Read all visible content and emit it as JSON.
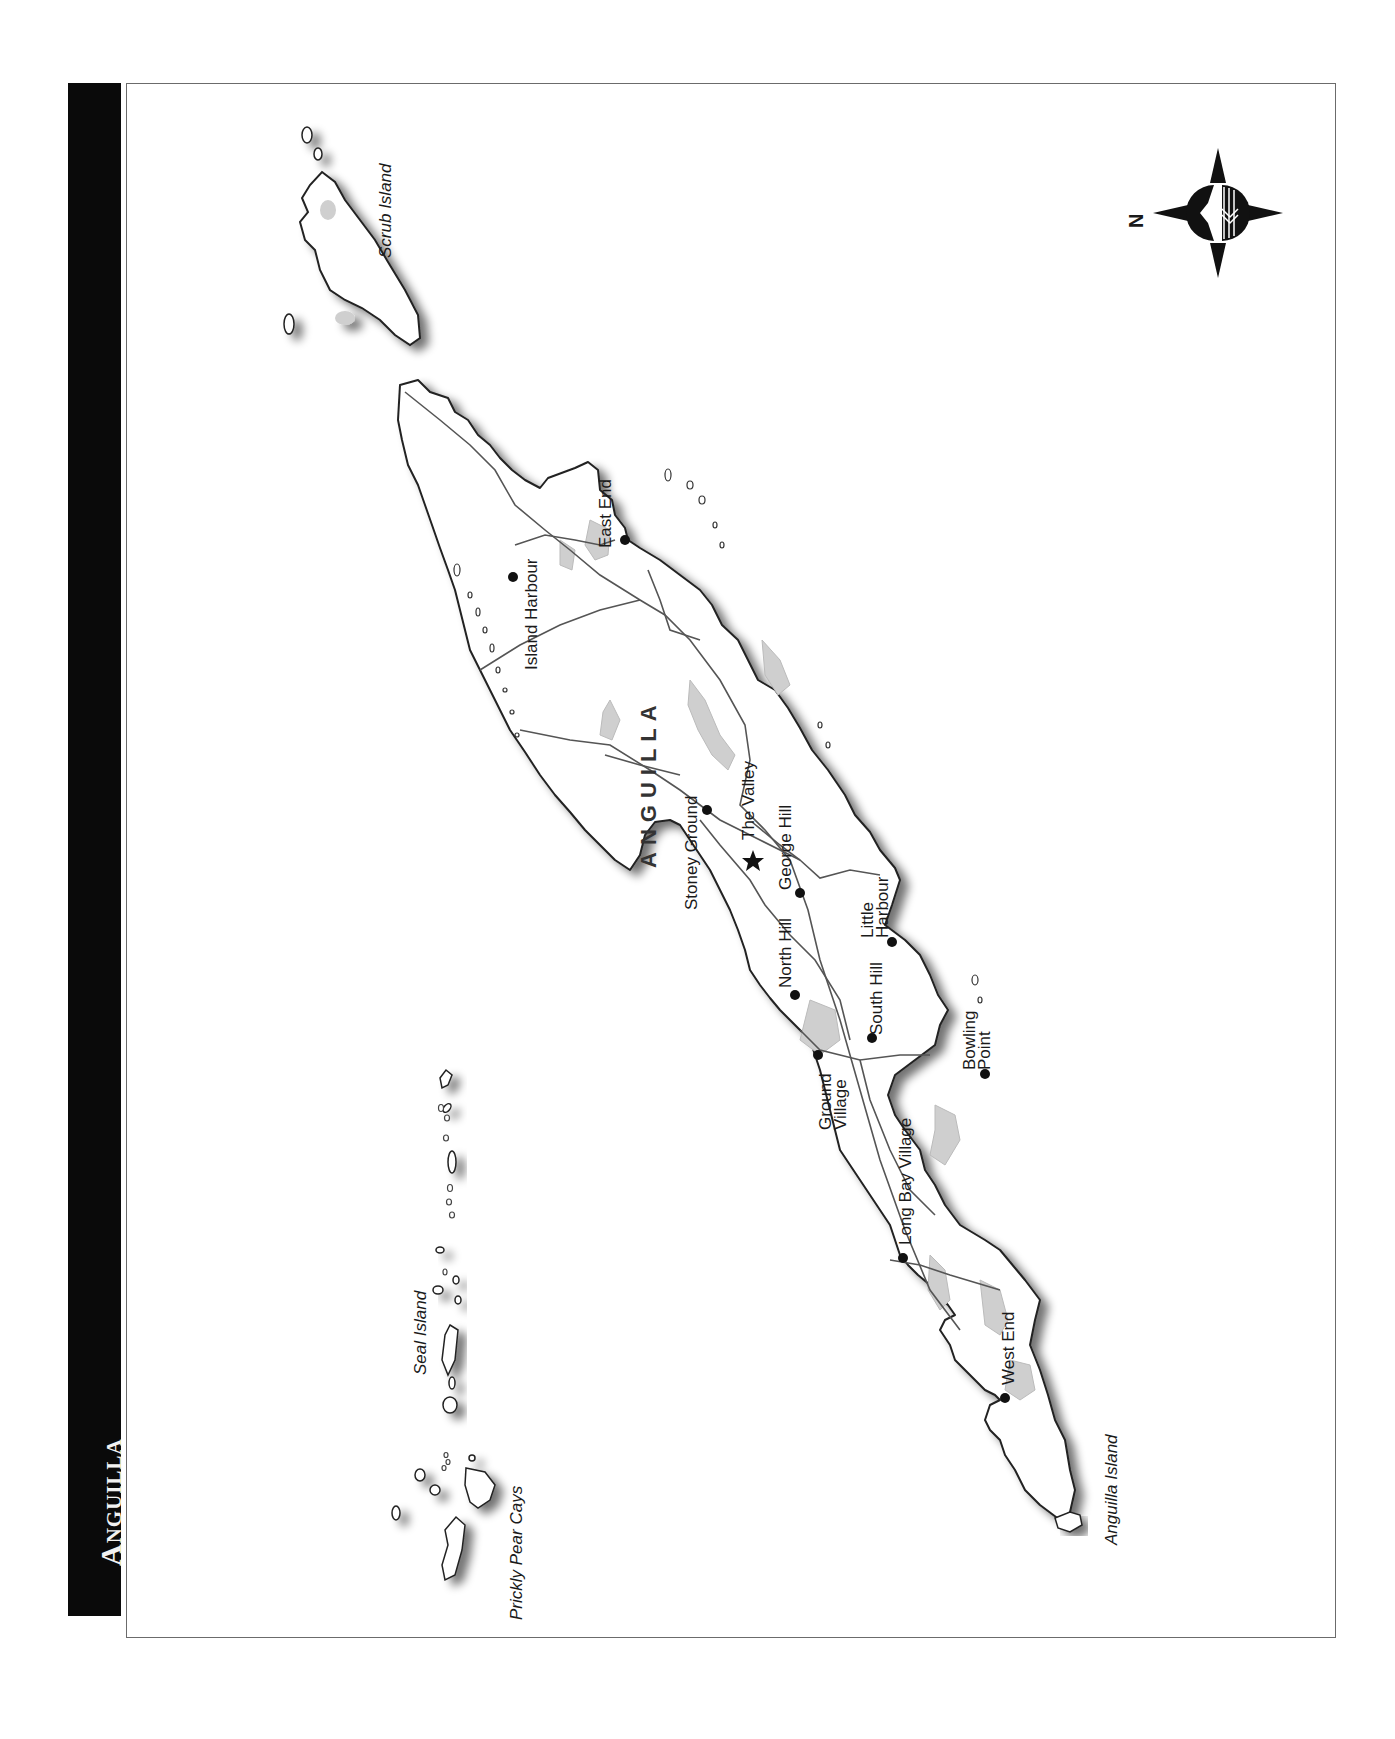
{
  "title": "Anguilla",
  "map": {
    "country_label": "ANGUILLA",
    "islands": [
      {
        "name": "Scrub Island"
      },
      {
        "name": "Seal Island"
      },
      {
        "name": "Prickly Pear Cays"
      },
      {
        "name": "Anguilla Island"
      }
    ],
    "towns": [
      {
        "name": "East End"
      },
      {
        "name": "Island Harbour"
      },
      {
        "name": "The Valley",
        "capital": true
      },
      {
        "name": "Stoney Ground"
      },
      {
        "name": "George Hill"
      },
      {
        "name": "North Hill"
      },
      {
        "name": "Little Harbour",
        "line1": "Little",
        "line2": "Harbour"
      },
      {
        "name": "South Hill"
      },
      {
        "name": "Ground Village",
        "line1": "Ground",
        "line2": "Village"
      },
      {
        "name": "Bowling Point",
        "line1": "Bowling",
        "line2": "Point"
      },
      {
        "name": "Long Bay Village"
      },
      {
        "name": "West End"
      }
    ],
    "compass": {
      "north_label": "N"
    },
    "colors": {
      "land": "#ffffff",
      "coast": "#222222",
      "road": "#555555",
      "pond": "#cfcfcf",
      "title_bg": "#0a0a0a"
    }
  }
}
